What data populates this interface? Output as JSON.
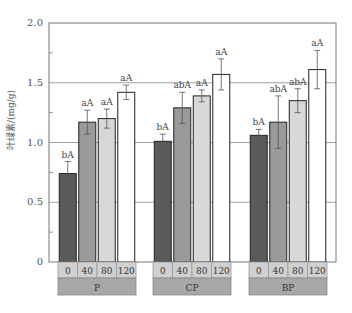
{
  "chart_data": {
    "type": "bar",
    "title": "",
    "xlabel": "",
    "ylabel": "叶绿素/(mg/g)",
    "ylim": [
      0,
      2.0
    ],
    "yticks": [
      "0",
      "0.5",
      "1.0",
      "1.5",
      "2.0"
    ],
    "grid": true,
    "groups": [
      "P",
      "CP",
      "BP"
    ],
    "categories": [
      "0",
      "40",
      "80",
      "120"
    ],
    "series": [
      {
        "name": "P",
        "values": [
          0.74,
          1.17,
          1.2,
          1.42
        ],
        "errors": [
          0.1,
          0.1,
          0.08,
          0.06
        ],
        "labels": [
          "bA",
          "aA",
          "aA",
          "aA"
        ]
      },
      {
        "name": "CP",
        "values": [
          1.01,
          1.29,
          1.39,
          1.57
        ],
        "errors": [
          0.06,
          0.13,
          0.05,
          0.13
        ],
        "labels": [
          "bA",
          "abA",
          "aA",
          "aA"
        ]
      },
      {
        "name": "BP",
        "values": [
          1.06,
          1.17,
          1.35,
          1.61
        ],
        "errors": [
          0.05,
          0.22,
          0.1,
          0.16
        ],
        "labels": [
          "bA",
          "abA",
          "abA",
          "aA"
        ]
      }
    ],
    "bar_colors": [
      "#5a5a5a",
      "#9a9a9a",
      "#d8d8d8",
      "#ffffff"
    ],
    "legend": "none"
  }
}
